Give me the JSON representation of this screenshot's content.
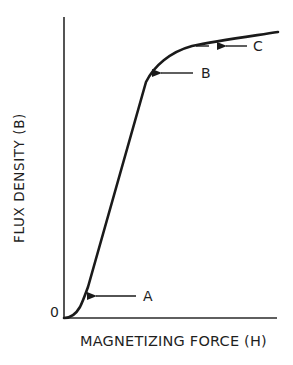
{
  "figure": {
    "type": "magnetization-curve",
    "axes": {
      "y_label": "FLUX DENSITY (B)",
      "x_label": "MAGNETIZING FORCE (H)",
      "origin_label": "0"
    },
    "points": [
      {
        "id": "A",
        "label": "A",
        "description": "knee at start of linear region"
      },
      {
        "id": "B",
        "label": "B",
        "description": "upper knee / onset of saturation"
      },
      {
        "id": "C",
        "label": "C",
        "description": "saturation region"
      }
    ],
    "colors": {
      "line": "#1a1a1a",
      "background": "#ffffff"
    }
  }
}
